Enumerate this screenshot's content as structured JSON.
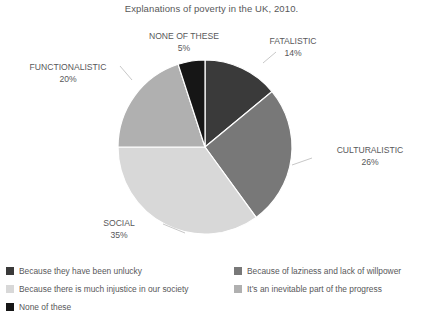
{
  "chart_data": {
    "type": "pie",
    "title": "Explanations of poverty in the UK, 2010.",
    "categories": [
      "FATALISTIC",
      "CULTURALISTIC",
      "SOCIAL",
      "FUNCTIONALISTIC",
      "NONE OF THESE"
    ],
    "values": [
      14,
      26,
      35,
      20,
      5
    ],
    "value_labels": [
      "14%",
      "26%",
      "35%",
      "20%",
      "5%"
    ],
    "unit": "%",
    "start_angle_deg": 0,
    "direction": "clockwise",
    "colors": [
      "#3a3a3a",
      "#787878",
      "#d8d8d8",
      "#b0b0b0",
      "#161616"
    ],
    "grid": false,
    "legend_position": "bottom",
    "legend_entries": [
      "Because they have been unlucky",
      "Because of laziness and lack of willpower",
      "Because there is much injustice in our society",
      "It’s an inevitable part of the progress",
      "None of these"
    ]
  },
  "title": "Explanations of poverty in the UK, 2010.",
  "slices": [
    {
      "name": "FATALISTIC",
      "pct": "14%",
      "color": "#3a3a3a"
    },
    {
      "name": "CULTURALISTIC",
      "pct": "26%",
      "color": "#787878"
    },
    {
      "name": "SOCIAL",
      "pct": "35%",
      "color": "#d8d8d8"
    },
    {
      "name": "FUNCTIONALISTIC",
      "pct": "20%",
      "color": "#b0b0b0"
    },
    {
      "name": "NONE OF THESE",
      "pct": "5%",
      "color": "#161616"
    }
  ],
  "legend": {
    "left": [
      {
        "label": "Because they have been unlucky",
        "color": "#3a3a3a"
      },
      {
        "label": "Because there is much injustice in our society",
        "color": "#d8d8d8"
      },
      {
        "label": "None of these",
        "color": "#161616"
      }
    ],
    "right": [
      {
        "label": "Because of laziness and lack of willpower",
        "color": "#787878"
      },
      {
        "label": "It’s an inevitable part of the progress",
        "color": "#b0b0b0"
      }
    ]
  }
}
